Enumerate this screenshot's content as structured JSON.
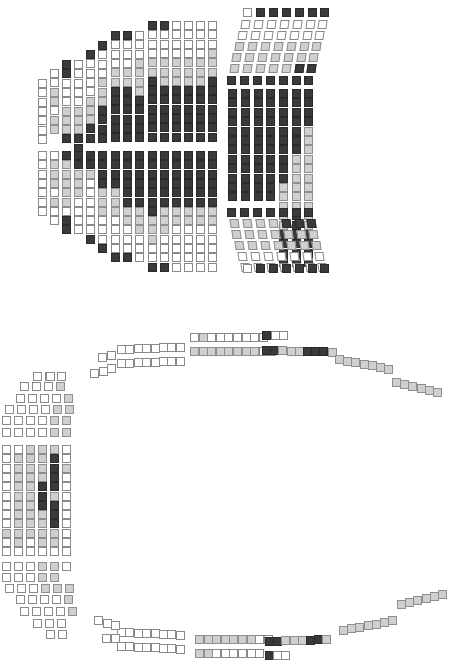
{
  "legend": {
    "w": "available",
    "g": "partially booked",
    "d": "sold"
  },
  "colors": {
    "available": "#ffffff",
    "partial": "#cfcfcf",
    "sold": "#3a3a3a",
    "outline": "#8a8a8a"
  },
  "seat_size": {
    "w": 9,
    "h": 9
  },
  "sections": [
    {
      "name": "orchestra-left-upper",
      "columns": [
        {
          "x": 38,
          "y": 79,
          "dy": 9.3,
          "seats": "wwwwwww"
        },
        {
          "x": 50,
          "y": 69,
          "dy": 9.3,
          "seats": "wwggwgg"
        },
        {
          "x": 62,
          "y": 60,
          "dy": 9.3,
          "seats": "ddwwwgggd"
        },
        {
          "x": 74,
          "y": 60,
          "dy": 9.3,
          "seats": "wwwwwgggdd"
        },
        {
          "x": 86,
          "y": 50,
          "dy": 9.3,
          "seats": "dwwwwgggdd"
        },
        {
          "x": 98,
          "y": 41,
          "dy": 9.3,
          "seats": "dwwwgggdddd"
        },
        {
          "x": 111,
          "y": 31,
          "dy": 9.3,
          "seats": "dwwwggdddddd"
        },
        {
          "x": 123,
          "y": 31,
          "dy": 9.3,
          "seats": "dwwwggdddddd"
        },
        {
          "x": 135,
          "y": 31,
          "dy": 9.3,
          "seats": "wwwggggddddd"
        },
        {
          "x": 148,
          "y": 21,
          "dy": 9.3,
          "seats": "dwwwggddddddd"
        },
        {
          "x": 160,
          "y": 21,
          "dy": 9.3,
          "seats": "dwwwgggdddddd"
        },
        {
          "x": 172,
          "y": 21,
          "dy": 9.3,
          "seats": "wwwwgggdddddd"
        },
        {
          "x": 184,
          "y": 21,
          "dy": 9.3,
          "seats": "wwwwgggdddddd"
        },
        {
          "x": 196,
          "y": 21,
          "dy": 9.3,
          "seats": "wwwwgggdddddd"
        },
        {
          "x": 208,
          "y": 21,
          "dy": 9.3,
          "seats": "wwwgggddddddd"
        }
      ]
    },
    {
      "name": "orchestra-left-lower",
      "columns": [
        {
          "x": 38,
          "y": 151,
          "dy": 9.3,
          "seats": "wwwwwww"
        },
        {
          "x": 50,
          "y": 151,
          "dy": 9.3,
          "seats": "wgggwgww"
        },
        {
          "x": 62,
          "y": 151,
          "dy": 9.3,
          "seats": "dgggggwdd"
        },
        {
          "x": 74,
          "y": 151,
          "dy": 9.3,
          "seats": "ddgggwwww"
        },
        {
          "x": 86,
          "y": 151,
          "dy": 9.3,
          "seats": "ddgwwwwwwd"
        },
        {
          "x": 98,
          "y": 151,
          "dy": 9.3,
          "seats": "ddddgggwwwd"
        },
        {
          "x": 111,
          "y": 151,
          "dy": 9.3,
          "seats": "ddddgggwwwwd"
        },
        {
          "x": 123,
          "y": 151,
          "dy": 9.3,
          "seats": "ddddddggwwwd"
        },
        {
          "x": 135,
          "y": 151,
          "dy": 9.3,
          "seats": "ddddddgggwww"
        },
        {
          "x": 148,
          "y": 151,
          "dy": 9.3,
          "seats": "dddddddgggwwd"
        },
        {
          "x": 160,
          "y": 151,
          "dy": 9.3,
          "seats": "ddddddgggwwwd"
        },
        {
          "x": 172,
          "y": 151,
          "dy": 9.3,
          "seats": "ddddddggwwwww"
        },
        {
          "x": 184,
          "y": 151,
          "dy": 9.3,
          "seats": "ddddddggwwwww"
        },
        {
          "x": 196,
          "y": 151,
          "dy": 9.3,
          "seats": "ddddddggwwwww"
        },
        {
          "x": 208,
          "y": 151,
          "dy": 9.3,
          "seats": "ddddddggwwwww"
        }
      ]
    },
    {
      "name": "orchestra-right-center",
      "columns": [
        {
          "x": 228,
          "y": 89,
          "dy": 9.4,
          "seats": "dddddddddddd"
        },
        {
          "x": 241,
          "y": 89,
          "dy": 9.4,
          "seats": "dddddddddddd"
        },
        {
          "x": 254,
          "y": 89,
          "dy": 9.4,
          "seats": "dddddddddddd"
        },
        {
          "x": 266,
          "y": 89,
          "dy": 9.4,
          "seats": "dddddddddddd"
        },
        {
          "x": 279,
          "y": 89,
          "dy": 9.4,
          "seats": "ddddddddddgggggdddd"
        },
        {
          "x": 292,
          "y": 89,
          "dy": 9.4,
          "seats": "dddddddggggggdddddd"
        },
        {
          "x": 304,
          "y": 89,
          "dy": 9.4,
          "seats": "ddddgggggggggggdddd"
        }
      ]
    },
    {
      "name": "orchestra-right-upper-rows",
      "rows": [
        {
          "x": 227,
          "y": 76,
          "dx": 12.9,
          "skew": 0,
          "seats": "ddddddd"
        },
        {
          "x": 230,
          "y": 64,
          "dx": 12.9,
          "skew": -8,
          "seats": "gggggdd"
        },
        {
          "x": 232,
          "y": 53,
          "dx": 12.9,
          "skew": -8,
          "seats": "ggggggg"
        },
        {
          "x": 235,
          "y": 42,
          "dx": 12.9,
          "skew": -8,
          "seats": "ggggggg"
        },
        {
          "x": 238,
          "y": 31,
          "dx": 12.9,
          "skew": -8,
          "seats": "wwwwwww"
        },
        {
          "x": 241,
          "y": 20,
          "dx": 12.9,
          "skew": -8,
          "seats": "wwwwwww"
        },
        {
          "x": 243,
          "y": 8,
          "dx": 12.9,
          "skew": 0,
          "seats": "wdddddd"
        }
      ]
    },
    {
      "name": "orchestra-right-lower-rows",
      "rows": [
        {
          "x": 227,
          "y": 208,
          "dx": 12.9,
          "skew": 0,
          "seats": "ddddddd"
        },
        {
          "x": 230,
          "y": 219,
          "dx": 12.9,
          "skew": 8,
          "seats": "ggggddd"
        },
        {
          "x": 232,
          "y": 230,
          "dx": 12.9,
          "skew": 8,
          "seats": "ggggggg"
        },
        {
          "x": 235,
          "y": 241,
          "dx": 12.9,
          "skew": 8,
          "seats": "ggggggg"
        },
        {
          "x": 238,
          "y": 252,
          "dx": 12.9,
          "skew": 8,
          "seats": "wwwwwww"
        },
        {
          "x": 241,
          "y": 263,
          "dx": 12.9,
          "skew": 8,
          "seats": "wwwwwww"
        },
        {
          "x": 243,
          "y": 264,
          "dx": 12.9,
          "skew": 0,
          "seats": "wdddddd"
        }
      ]
    },
    {
      "name": "balcony-top-rows",
      "rows": [
        {
          "x": 117,
          "y": 345,
          "dx": 8.4,
          "rise": -0.35,
          "seats": "wwwwwwww"
        },
        {
          "x": 117,
          "y": 359,
          "dx": 8.4,
          "rise": -0.35,
          "seats": "wwwwwwww"
        },
        {
          "x": 190,
          "y": 333,
          "dx": 8.6,
          "rise": 0,
          "seats": "wgwwwwwww"
        },
        {
          "x": 190,
          "y": 347,
          "dx": 8.6,
          "rise": 0,
          "seats": "ggggggggww"
        },
        {
          "x": 262,
          "y": 331,
          "dx": 8.6,
          "rise": 0,
          "seats": "dww"
        },
        {
          "x": 262,
          "y": 346,
          "dx": 8.2,
          "rise": 0.2,
          "seats": "ddgggdddg"
        },
        {
          "x": 335,
          "y": 355,
          "dx": 8.2,
          "rise": 1.6,
          "seats": "ggggggg"
        },
        {
          "x": 392,
          "y": 378,
          "dx": 8.2,
          "rise": 2.0,
          "seats": "gggggg"
        }
      ]
    },
    {
      "name": "balcony-top-left-stub",
      "rows": [
        {
          "x": 98,
          "y": 353,
          "dx": 8.5,
          "rise": -2.5,
          "seats": "ww"
        },
        {
          "x": 90,
          "y": 369,
          "dx": 8.5,
          "rise": -2.5,
          "seats": "www"
        }
      ]
    },
    {
      "name": "balcony-bottom-rows",
      "rows": [
        {
          "x": 117,
          "y": 628,
          "dx": 8.4,
          "rise": 0.35,
          "seats": "wwwwwwww"
        },
        {
          "x": 117,
          "y": 642,
          "dx": 8.4,
          "rise": 0.35,
          "seats": "wwwwwwww"
        },
        {
          "x": 195,
          "y": 635,
          "dx": 8.6,
          "rise": 0,
          "seats": "gggggggww"
        },
        {
          "x": 195,
          "y": 649,
          "dx": 8.6,
          "rise": 0,
          "seats": "ggwwwwww"
        },
        {
          "x": 265,
          "y": 637,
          "dx": 8.2,
          "rise": -0.3,
          "seats": "ddgggddg"
        },
        {
          "x": 265,
          "y": 651,
          "dx": 8.2,
          "rise": 0,
          "seats": "dww"
        },
        {
          "x": 339,
          "y": 626,
          "dx": 8.2,
          "rise": -1.6,
          "seats": "ggggggg"
        },
        {
          "x": 397,
          "y": 600,
          "dx": 8.2,
          "rise": -2.0,
          "seats": "gggggg"
        }
      ]
    },
    {
      "name": "balcony-bottom-left-stub",
      "rows": [
        {
          "x": 94,
          "y": 616,
          "dx": 8.5,
          "rise": 2.5,
          "seats": "www"
        },
        {
          "x": 102,
          "y": 634,
          "dx": 8.5,
          "rise": 0,
          "seats": "ww"
        }
      ]
    },
    {
      "name": "balcony-left-center",
      "columns": [
        {
          "x": 2,
          "y": 445,
          "dy": 9.3,
          "seats": "wwwwwwwwwgww"
        },
        {
          "x": 14,
          "y": 445,
          "dy": 9.3,
          "seats": "wggggggggggw"
        },
        {
          "x": 26,
          "y": 445,
          "dy": 9.3,
          "seats": "ggggggggggww"
        },
        {
          "x": 38,
          "y": 445,
          "dy": 9.3,
          "seats": "ggggdddggggw"
        },
        {
          "x": 50,
          "y": 445,
          "dy": 9.3,
          "seats": "gddddgdddggw"
        },
        {
          "x": 62,
          "y": 445,
          "dy": 9.3,
          "seats": "wwgwwwwwwwww"
        }
      ]
    },
    {
      "name": "balcony-left-upper-rows",
      "rows": [
        {
          "x": 2,
          "y": 428,
          "dx": 12,
          "rise": 0,
          "seats": "wwwwgg"
        },
        {
          "x": 2,
          "y": 416,
          "dx": 12,
          "rise": 0,
          "seats": "wwwwgg"
        },
        {
          "x": 5,
          "y": 405,
          "dx": 12,
          "rise": 0,
          "seats": "wwwwgg"
        },
        {
          "x": 16,
          "y": 394,
          "dx": 12,
          "rise": 0,
          "seats": "wwwwg"
        },
        {
          "x": 20,
          "y": 382,
          "dx": 12,
          "rise": 0,
          "seats": "wwwg"
        },
        {
          "x": 33,
          "y": 372,
          "dx": 12,
          "rise": 0,
          "seats": "www"
        },
        {
          "x": 46,
          "y": 372,
          "dx": 12,
          "rise": 0,
          "seats": "w"
        }
      ]
    },
    {
      "name": "balcony-left-lower-rows",
      "rows": [
        {
          "x": 2,
          "y": 562,
          "dx": 12,
          "rise": 0,
          "seats": "wwwggw"
        },
        {
          "x": 2,
          "y": 573,
          "dx": 12,
          "rise": 0,
          "seats": "wwwgg"
        },
        {
          "x": 5,
          "y": 584,
          "dx": 12,
          "rise": 0,
          "seats": "wwwggg"
        },
        {
          "x": 16,
          "y": 595,
          "dx": 12,
          "rise": 0,
          "seats": "wwwwg"
        },
        {
          "x": 20,
          "y": 607,
          "dx": 12,
          "rise": 0,
          "seats": "wwwwg"
        },
        {
          "x": 33,
          "y": 619,
          "dx": 12,
          "rise": 0,
          "seats": "www"
        },
        {
          "x": 46,
          "y": 630,
          "dx": 12,
          "rise": 0,
          "seats": "ww"
        }
      ]
    }
  ]
}
